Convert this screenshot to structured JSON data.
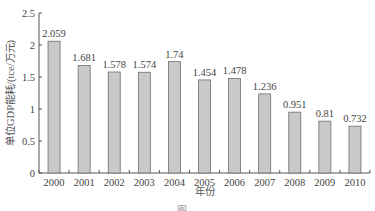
{
  "chart_data": {
    "type": "bar",
    "title": "",
    "xlabel": "年份",
    "ylabel": "单位GDP能耗/(tce/万元)",
    "categories": [
      "2000",
      "2001",
      "2002",
      "2003",
      "2004",
      "2005",
      "2006",
      "2007",
      "2008",
      "2009",
      "2010"
    ],
    "values": [
      2.059,
      1.681,
      1.578,
      1.574,
      1.74,
      1.454,
      1.478,
      1.236,
      0.951,
      0.81,
      0.732
    ],
    "value_labels": [
      "2.059",
      "1.681",
      "1.578",
      "1.574",
      "1.74",
      "1.454",
      "1.478",
      "1.236",
      "0.951",
      "0.81",
      "0.732"
    ],
    "ylim": [
      0,
      2.5
    ],
    "yticks": [
      0,
      0.5,
      1,
      1.5,
      2,
      2.5
    ],
    "ytick_labels": [
      "0",
      "0.5",
      "1",
      "1.5",
      "2",
      "2.5"
    ],
    "grid": false,
    "legend": null,
    "colors": {
      "bar_fill": "#c9c9c9",
      "bar_stroke": "#6e6e6e",
      "axis": "#555555"
    }
  },
  "caption_partial": "图"
}
